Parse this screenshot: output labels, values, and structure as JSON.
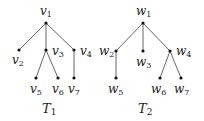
{
  "trees": [
    {
      "name": "T",
      "name_sub": "1",
      "title_pos": [
        42,
        113
      ],
      "nodes": [
        {
          "id": "v1",
          "letter": "v",
          "sub": "1",
          "x": 46,
          "y": 23,
          "lx": 40,
          "ly": 15
        },
        {
          "id": "v2",
          "letter": "v",
          "sub": "2",
          "x": 19,
          "y": 50,
          "lx": 12,
          "ly": 64
        },
        {
          "id": "v3",
          "letter": "v",
          "sub": "3",
          "x": 46,
          "y": 50,
          "lx": 52,
          "ly": 55
        },
        {
          "id": "v4",
          "letter": "v",
          "sub": "4",
          "x": 74,
          "y": 50,
          "lx": 80,
          "ly": 55
        },
        {
          "id": "v5",
          "letter": "v",
          "sub": "5",
          "x": 36,
          "y": 78,
          "lx": 30,
          "ly": 93
        },
        {
          "id": "v6",
          "letter": "v",
          "sub": "6",
          "x": 58,
          "y": 78,
          "lx": 52,
          "ly": 93
        },
        {
          "id": "v7",
          "letter": "v",
          "sub": "7",
          "x": 74,
          "y": 78,
          "lx": 68,
          "ly": 93
        }
      ],
      "edges": [
        [
          "v1",
          "v2"
        ],
        [
          "v1",
          "v3"
        ],
        [
          "v1",
          "v4"
        ],
        [
          "v3",
          "v5"
        ],
        [
          "v3",
          "v6"
        ],
        [
          "v4",
          "v7"
        ]
      ]
    },
    {
      "name": "T",
      "name_sub": "2",
      "title_pos": [
        138,
        113
      ],
      "nodes": [
        {
          "id": "w1",
          "letter": "w",
          "sub": "1",
          "x": 143,
          "y": 23,
          "lx": 136,
          "ly": 15
        },
        {
          "id": "w2",
          "letter": "w",
          "sub": "2",
          "x": 116,
          "y": 51,
          "lx": 99,
          "ly": 55
        },
        {
          "id": "w3",
          "letter": "w",
          "sub": "3",
          "x": 143,
          "y": 51,
          "lx": 136,
          "ly": 66
        },
        {
          "id": "w4",
          "letter": "w",
          "sub": "4",
          "x": 170,
          "y": 51,
          "lx": 176,
          "ly": 55
        },
        {
          "id": "w5",
          "letter": "w",
          "sub": "5",
          "x": 116,
          "y": 78,
          "lx": 108,
          "ly": 93
        },
        {
          "id": "w6",
          "letter": "w",
          "sub": "6",
          "x": 160,
          "y": 78,
          "lx": 151,
          "ly": 93
        },
        {
          "id": "w7",
          "letter": "w",
          "sub": "7",
          "x": 181,
          "y": 78,
          "lx": 174,
          "ly": 93
        }
      ],
      "edges": [
        [
          "w1",
          "w2"
        ],
        [
          "w1",
          "w3"
        ],
        [
          "w1",
          "w4"
        ],
        [
          "w2",
          "w5"
        ],
        [
          "w4",
          "w6"
        ],
        [
          "w4",
          "w7"
        ]
      ]
    }
  ]
}
